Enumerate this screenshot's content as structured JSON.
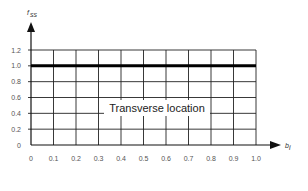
{
  "chart_data": {
    "type": "line",
    "title": "",
    "xlabel": "b_i",
    "ylabel": "f_ss",
    "x_ticks": [
      "0",
      "0.1",
      "0.2",
      "0.3",
      "0.4",
      "0.5",
      "0.6",
      "0.7",
      "0.8",
      "0.9",
      "1.0"
    ],
    "y_ticks": [
      "0",
      "0.2",
      "0.4",
      "0.6",
      "0.8",
      "1.0",
      "1.2"
    ],
    "xlim": [
      0,
      1.0
    ],
    "ylim": [
      0,
      1.2
    ],
    "grid": true,
    "series": [
      {
        "name": "f_ss",
        "x": [
          0,
          1.0
        ],
        "y": [
          1.0,
          1.0
        ],
        "color": "#000000",
        "linewidth": "thick"
      }
    ],
    "annotations": [
      {
        "text": "Transverse location",
        "x": 0.55,
        "y": 0.5
      }
    ]
  },
  "labels": {
    "y_axis": "fss",
    "x_axis": "bi",
    "annotation": "Transverse location"
  }
}
